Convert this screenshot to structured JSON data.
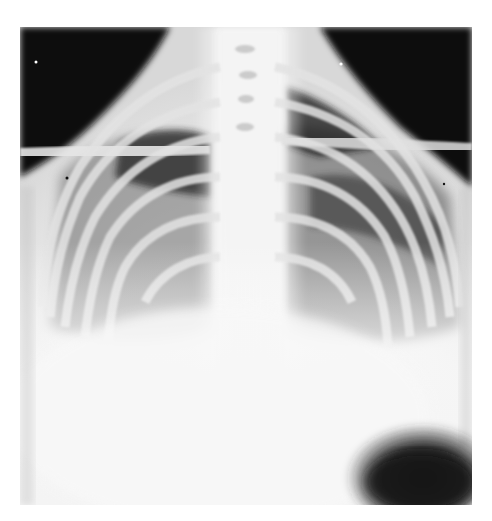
{
  "image": {
    "type": "chest radiograph",
    "view": "frontal (PA/AP)",
    "description": "Chest X-ray showing rib cage, clavicles, spine and mediastinum; dense opacification of lower lung fields; dark gas bubble at lower right",
    "colors": {
      "background": "#ffffff",
      "air_dark": "#0d0d0d",
      "bone_bright": "#f2f2f2",
      "soft_tissue": "#e8e8e8"
    }
  }
}
